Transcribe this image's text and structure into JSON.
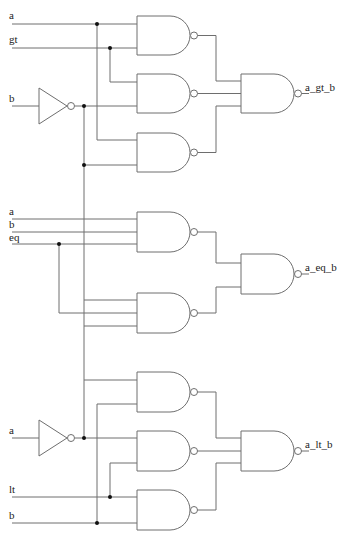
{
  "diagram": {
    "type": "logic-circuit",
    "sections": [
      {
        "id": "gt",
        "input_labels": [
          "a",
          "gt",
          "b"
        ],
        "output_label": "a_gt_b",
        "inverted_input": "b",
        "first_stage_gates": 3,
        "output_gate": "NAND3"
      },
      {
        "id": "eq",
        "input_labels": [
          "a",
          "b",
          "eq"
        ],
        "output_label": "a_eq_b",
        "first_stage_gates": 2,
        "output_gate": "NAND2"
      },
      {
        "id": "lt",
        "input_labels": [
          "a",
          "lt",
          "b"
        ],
        "output_label": "a_lt_b",
        "inverted_input": "a",
        "first_stage_gates": 3,
        "output_gate": "NAND3"
      }
    ],
    "labels": {
      "gt_in_a": "a",
      "gt_in_gt": "gt",
      "gt_in_b": "b",
      "gt_out": "a_gt_b",
      "eq_in_a": "a",
      "eq_in_b": "b",
      "eq_in_eq": "eq",
      "eq_out": "a_eq_b",
      "lt_in_a": "a",
      "lt_in_lt": "lt",
      "lt_in_b": "b",
      "lt_out": "a_lt_b"
    },
    "colors": {
      "wire": "#6e6e6e",
      "junction": "#111111",
      "text": "#222222",
      "background": "#ffffff"
    }
  }
}
